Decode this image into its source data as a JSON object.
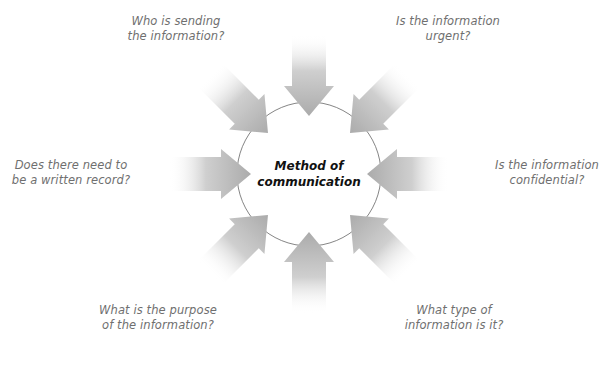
{
  "diagram": {
    "type": "radial-converging-arrows",
    "center": {
      "line1": "Method of",
      "line2": "communication"
    },
    "questions": [
      {
        "id": "who",
        "line1": "Who is sending",
        "line2": "the information?",
        "direction": "from-top-left"
      },
      {
        "id": "urgent",
        "line1": "Is the information",
        "line2": "urgent?",
        "direction": "from-top-right"
      },
      {
        "id": "record",
        "line1": "Does there need to",
        "line2": "be a written record?",
        "direction": "from-left"
      },
      {
        "id": "confidential",
        "line1": "Is the information",
        "line2": "confidential?",
        "direction": "from-right"
      },
      {
        "id": "purpose",
        "line1": "What is the purpose",
        "line2": "of the information?",
        "direction": "from-bottom-left"
      },
      {
        "id": "type",
        "line1": "What type of",
        "line2": "information is it?",
        "direction": "from-bottom-right"
      }
    ],
    "arrows": [
      {
        "name": "arrow-top",
        "from": "top"
      },
      {
        "name": "arrow-top-right",
        "from": "top-right"
      },
      {
        "name": "arrow-right",
        "from": "right"
      },
      {
        "name": "arrow-bottom-right",
        "from": "bottom-right"
      },
      {
        "name": "arrow-bottom",
        "from": "bottom"
      },
      {
        "name": "arrow-bottom-left",
        "from": "bottom-left"
      },
      {
        "name": "arrow-left",
        "from": "left"
      },
      {
        "name": "arrow-top-left",
        "from": "top-left"
      }
    ],
    "colors": {
      "arrow": "#b3b3b3",
      "circle_stroke": "#666666",
      "label_text": "#6f6f6f",
      "center_text": "#111111"
    }
  }
}
